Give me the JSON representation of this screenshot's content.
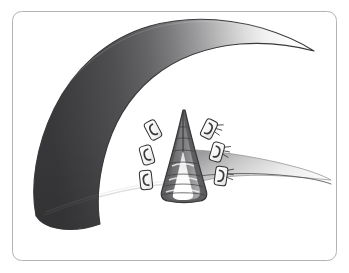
{
  "figure": {
    "title": "Surgical repair illustration",
    "description": "Grayscale medical illustration of a curved tissue flap with a V-shaped vertical incision closed by six surgical clips",
    "domain_label": "medical-illustration"
  },
  "frame": {
    "border_color": "#b4b4b4",
    "background_color": "#ffffff",
    "corner_radius": 9,
    "x": 12,
    "y": 11,
    "width": 325,
    "height": 250
  },
  "palette": {
    "tissue_dark": "#4a4a4c",
    "tissue_mid": "#8e8e90",
    "tissue_light": "#e6e6e6",
    "tissue_highlight": "#fcfcfc",
    "outline_dark": "#3a3a3c",
    "outline_mid": "#6b6b6d",
    "incision_wall": "#6a6a6c",
    "incision_deep": "#57575a",
    "incision_floor": "#ffffff",
    "clip_body": "#f8f8f8",
    "clip_outline": "#2f2f31",
    "suture_line": "#4a4a4c",
    "wing_light": "#f2f2f2",
    "page_background": "#ffffff"
  },
  "anatomy": {
    "main_flap": {
      "name": "tissue-flap",
      "gradient_from": "#3f3f41",
      "gradient_to": "#fbfbfb",
      "gradient_direction": "left-to-right"
    },
    "incision": {
      "name": "v-incision",
      "shape": "V",
      "apex_x": 183,
      "apex_y": 114,
      "left_base_x": 163,
      "right_base_x": 203,
      "base_y": 196
    },
    "incision_floor": {
      "name": "incision-floor",
      "color": "#ffffff",
      "rung_count": 4
    },
    "right_wing": {
      "name": "tapered-wing",
      "tip_x": 330,
      "tip_y": 163
    },
    "bottom_edge_crease": {
      "name": "bottom-crease",
      "color": "#6b6b6d"
    }
  },
  "clips": {
    "count": 6,
    "left_label": "left-clip-row",
    "right_label": "right-clip-row",
    "items": [
      {
        "id": "clip-left-1",
        "side": "left",
        "index": 1,
        "x": 153,
        "y": 130,
        "rotation": -28
      },
      {
        "id": "clip-left-2",
        "side": "left",
        "index": 2,
        "x": 147,
        "y": 155,
        "rotation": -18
      },
      {
        "id": "clip-left-3",
        "side": "left",
        "index": 3,
        "x": 146,
        "y": 180,
        "rotation": -8
      },
      {
        "id": "clip-right-1",
        "side": "right",
        "index": 1,
        "x": 209,
        "y": 129,
        "rotation": 26
      },
      {
        "id": "clip-right-2",
        "side": "right",
        "index": 2,
        "x": 217,
        "y": 152,
        "rotation": 16
      },
      {
        "id": "clip-right-3",
        "side": "right",
        "index": 3,
        "x": 221,
        "y": 176,
        "rotation": 8
      }
    ]
  },
  "suture_rungs": {
    "name": "suture-rungs",
    "count": 7,
    "color": "#3f3f41"
  }
}
